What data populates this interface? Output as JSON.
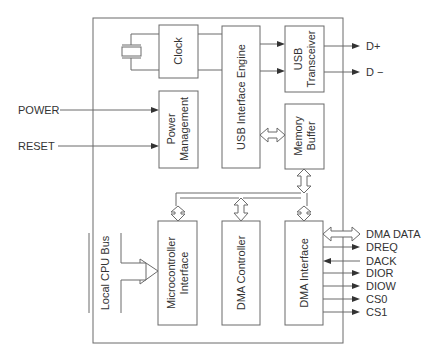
{
  "diagram": {
    "type": "block-diagram",
    "blocks": {
      "clock": "Clock",
      "usb_engine": "USB Interface Engine",
      "usb_transceiver_1": "USB",
      "usb_transceiver_2": "Transceiver",
      "power_1": "Power",
      "power_2": "Management",
      "memory_1": "Memory",
      "memory_2": "Buffer",
      "micro_1": "Microcontroller",
      "micro_2": "Interface",
      "dma_controller": "DMA Controller",
      "dma_interface": "DMA Interface"
    },
    "inputs": {
      "power": "POWER",
      "reset": "RESET",
      "local_bus": "Local CPU Bus"
    },
    "outputs": {
      "d_plus": "D+",
      "d_minus": "D −"
    },
    "dma_signals": [
      {
        "label": "DMA DATA",
        "direction": "bidirectional-bus"
      },
      {
        "label": "DREQ",
        "direction": "out"
      },
      {
        "label": "DACK",
        "direction": "in"
      },
      {
        "label": "DIOR",
        "direction": "out"
      },
      {
        "label": "DIOW",
        "direction": "out"
      },
      {
        "label": "CS0",
        "direction": "out"
      },
      {
        "label": "CS1",
        "direction": "out"
      }
    ],
    "icons": {
      "crystal": "crystal-oscillator-icon"
    }
  }
}
